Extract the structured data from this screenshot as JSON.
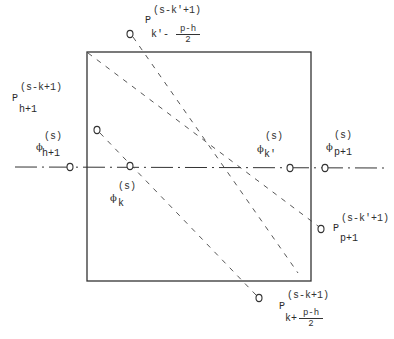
{
  "diagram": {
    "type": "geometric construction",
    "box": {
      "x1": 87,
      "y1": 52,
      "x2": 311,
      "y2": 281
    },
    "horizontal_line": {
      "y": 167,
      "x1": 15,
      "x2": 384,
      "style": "dash-dot"
    },
    "dashed_lines": [
      {
        "from": [
          97,
          130
        ],
        "to": [
          259,
          298
        ]
      },
      {
        "from": [
          130,
          34
        ],
        "to": [
          298,
          273
        ]
      },
      {
        "from": [
          87,
          52
        ],
        "to": [
          321,
          229
        ]
      }
    ],
    "points": [
      {
        "name": "P_k'-(p-h)/2",
        "x": 130,
        "y": 34
      },
      {
        "name": "P_h+1",
        "x": 97,
        "y": 130
      },
      {
        "name": "phi_h+1",
        "x": 70,
        "y": 167
      },
      {
        "name": "phi_k",
        "x": 130,
        "y": 166
      },
      {
        "name": "phi_k'",
        "x": 290,
        "y": 168
      },
      {
        "name": "phi_p+1",
        "x": 325,
        "y": 168
      },
      {
        "name": "P_p+1",
        "x": 321,
        "y": 229
      },
      {
        "name": "P_k+(p-h)/2",
        "x": 259,
        "y": 298
      }
    ]
  },
  "labels": {
    "top": {
      "base": "P",
      "sup": "(s-k'+1)",
      "sub": "k'-",
      "frac_num": "p-h",
      "frac_den": "2"
    },
    "left_p": {
      "base": "P",
      "sup": "(s-k+1)",
      "sub": "h+1"
    },
    "left_phi": {
      "base": "ϕ",
      "sup": "(s)",
      "sub": "h+1"
    },
    "phi_k": {
      "base": "ϕ",
      "sup": "(s)",
      "sub": "k"
    },
    "phi_kprime": {
      "base": "ϕ",
      "sup": "(s)",
      "sub": "k'"
    },
    "phi_p1": {
      "base": "ϕ",
      "sup": "(s)",
      "sub": "p+1"
    },
    "right_p": {
      "base": "P",
      "sup": "(s-k'+1)",
      "sub": "p+1"
    },
    "bottom": {
      "base": "P",
      "sup": "(s-k+1)",
      "sub": "k+",
      "frac_num": "p-h",
      "frac_den": "2"
    }
  }
}
